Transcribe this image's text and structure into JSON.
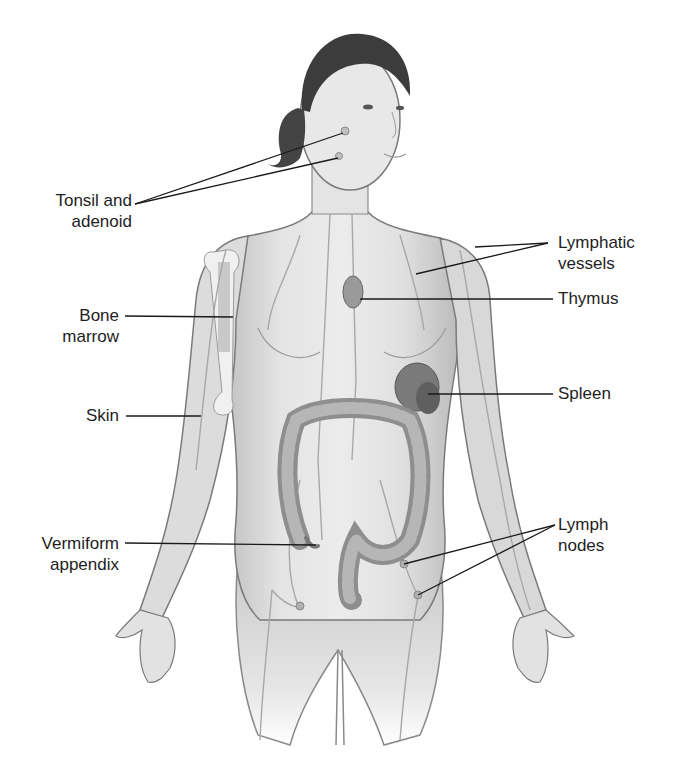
{
  "diagram": {
    "colors": {
      "skin": "#d9d9d9",
      "outline": "#7a7a7a",
      "hair": "#3c3c3c",
      "organ": "#8a8a8a",
      "leader": "#1a1a1a",
      "text": "#1e1e1e"
    },
    "labels": [
      {
        "id": "tonsil",
        "lines": [
          "Tonsil and",
          "adenoid"
        ],
        "side": "left"
      },
      {
        "id": "bone-marrow",
        "lines": [
          "Bone",
          "marrow"
        ],
        "side": "left"
      },
      {
        "id": "skin",
        "lines": [
          "Skin"
        ],
        "side": "left"
      },
      {
        "id": "vermiform",
        "lines": [
          "Vermiform",
          "appendix"
        ],
        "side": "left"
      },
      {
        "id": "lymphatic",
        "lines": [
          "Lymphatic",
          "vessels"
        ],
        "side": "right"
      },
      {
        "id": "thymus",
        "lines": [
          "Thymus"
        ],
        "side": "right"
      },
      {
        "id": "spleen",
        "lines": [
          "Spleen"
        ],
        "side": "right"
      },
      {
        "id": "lymph-nodes",
        "lines": [
          "Lymph",
          "nodes"
        ],
        "side": "right"
      }
    ]
  }
}
